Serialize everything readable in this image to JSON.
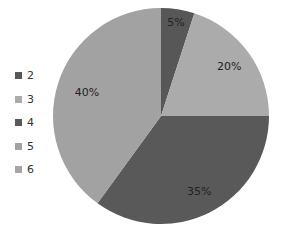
{
  "chart_data": {
    "type": "pie",
    "title": "",
    "categories": [
      "2",
      "3",
      "4",
      "5",
      "6"
    ],
    "values": [
      5,
      20,
      35,
      40,
      0
    ],
    "labels": [
      "5%",
      "20%",
      "35%",
      "40%",
      ""
    ],
    "colors": [
      "#575757",
      "#ababab",
      "#595959",
      "#a2a2a2",
      "#a6a6a6"
    ],
    "start_angle_deg": 0,
    "direction": "clockwise",
    "legend_position": "left"
  },
  "legend": {
    "items": [
      {
        "label": "2",
        "color": "#575757"
      },
      {
        "label": "3",
        "color": "#ababab"
      },
      {
        "label": "4",
        "color": "#595959"
      },
      {
        "label": "5",
        "color": "#a2a2a2"
      },
      {
        "label": "6",
        "color": "#a6a6a6"
      }
    ]
  }
}
